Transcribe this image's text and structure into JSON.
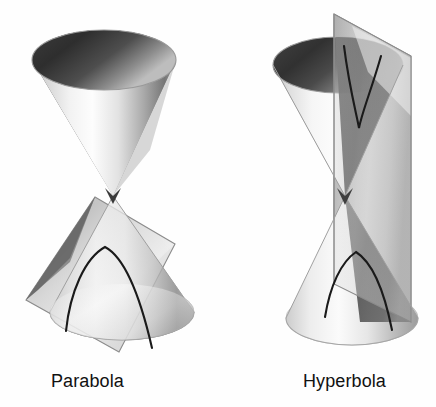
{
  "figure": {
    "background_color": "#fefefe",
    "ink_color": "#111111",
    "curve_color": "#1a1a1a",
    "panels": [
      {
        "id": "parabola",
        "caption": "Parabola",
        "caption_x": 51,
        "caption_y": 371,
        "description": "Double cone cut by a plane parallel to one slant line, producing a parabola",
        "cone": {
          "apex_x": 113,
          "apex_y": 196,
          "upper_rim_cx": 104,
          "upper_rim_cy": 60,
          "upper_rim_rx": 72,
          "upper_rim_ry": 30,
          "lower_rim_cx": 122,
          "lower_rim_cy": 312,
          "lower_rim_rx": 72,
          "lower_rim_ry": 28
        },
        "plane": {
          "shape": "tilted-quadrilateral",
          "points": "95,197 175,244 119,352 26,300"
        },
        "section_curve": {
          "type": "parabola",
          "apex_x": 105,
          "apex_y": 247,
          "left_end_x": 66,
          "left_end_y": 330,
          "right_end_x": 152,
          "right_end_y": 348,
          "opens": "down"
        }
      },
      {
        "id": "hyperbola",
        "caption": "Hyperbola",
        "caption_x": 303,
        "caption_y": 371,
        "description": "Double cone cut by a near-vertical plane through both nappes, producing two hyperbola branches",
        "cone": {
          "apex_x": 345,
          "apex_y": 196,
          "upper_rim_cx": 338,
          "upper_rim_cy": 65,
          "upper_rim_rx": 65,
          "upper_rim_ry": 28,
          "lower_rim_cx": 352,
          "lower_rim_cy": 318,
          "lower_rim_rx": 66,
          "lower_rim_ry": 27
        },
        "plane": {
          "shape": "vertical-slab",
          "points": "334,14 411,56 411,322 334,284"
        },
        "section_curve": {
          "type": "hyperbola",
          "branches": 2,
          "upper_branch_apex_x": 359,
          "upper_branch_apex_y": 128,
          "upper_branch_opens": "up",
          "lower_branch_apex_x": 356,
          "lower_branch_apex_y": 252,
          "lower_branch_opens": "down"
        }
      }
    ]
  }
}
